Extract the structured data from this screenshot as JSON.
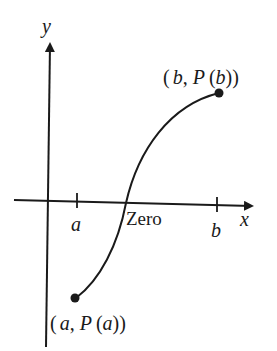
{
  "diagram": {
    "axes": {
      "x_label": "x",
      "y_label": "y"
    },
    "ticks": {
      "a_label": "a",
      "b_label": "b"
    },
    "zero_label": "Zero",
    "points": {
      "start": {
        "open": "(",
        "var": "a",
        "comma": ",",
        "func": "P",
        "arg": "a",
        "close": "))",
        "paren_open": "("
      },
      "end": {
        "open": "(",
        "var": "b",
        "comma": ",",
        "func": "P",
        "arg": "b",
        "close": "))",
        "paren_open": "("
      }
    },
    "colors": {
      "line": "#1a1a1a",
      "background": "#ffffff"
    }
  }
}
